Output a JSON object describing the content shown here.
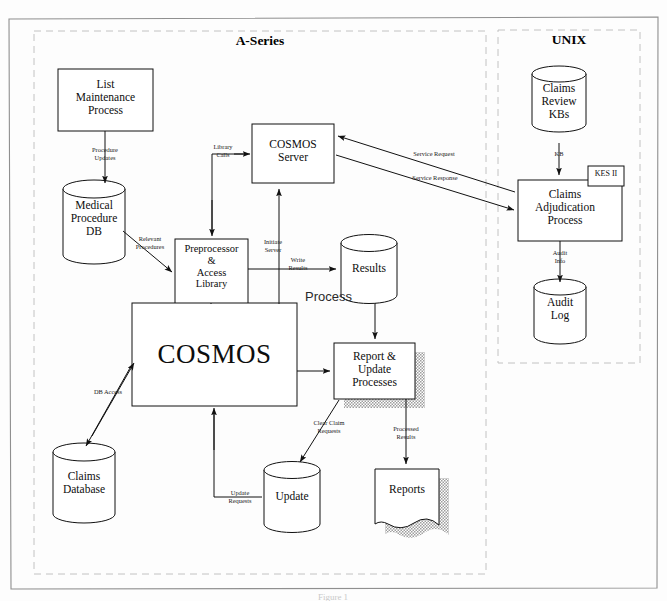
{
  "figure": {
    "caption": "Figure 1",
    "zones": [
      {
        "id": "a-series",
        "title": "A-Series"
      },
      {
        "id": "unix",
        "title": "UNIX"
      }
    ],
    "free_labels": [
      {
        "id": "process-label",
        "text": "Process"
      }
    ]
  },
  "nodes": [
    {
      "id": "list-maintenance-process",
      "shape": "rect",
      "label": "List\nMaintenance\nProcess"
    },
    {
      "id": "medical-procedure-db",
      "shape": "cylinder",
      "label": "Medical\nProcedure\nDB"
    },
    {
      "id": "cosmos-server",
      "shape": "rect",
      "label": "COSMOS\nServer"
    },
    {
      "id": "preprocessor-access-library",
      "shape": "rect",
      "label": "Preprocessor\n&\nAccess\nLibrary"
    },
    {
      "id": "cosmos",
      "shape": "rect",
      "label": "COSMOS"
    },
    {
      "id": "results",
      "shape": "cylinder",
      "label": "Results"
    },
    {
      "id": "report-update-processes",
      "shape": "rect-shadow",
      "label": "Report &\nUpdate\nProcesses"
    },
    {
      "id": "claims-database",
      "shape": "cylinder",
      "label": "Claims\nDatabase"
    },
    {
      "id": "update",
      "shape": "cylinder",
      "label": "Update"
    },
    {
      "id": "reports",
      "shape": "document",
      "label": "Reports"
    },
    {
      "id": "claims-review-kbs",
      "shape": "cylinder",
      "label": "Claims\nReview\nKBs"
    },
    {
      "id": "claims-adjudication-process",
      "shape": "rect",
      "label": "Claims\nAdjudication\nProcess"
    },
    {
      "id": "kes-ii",
      "shape": "rect",
      "label": "KES II"
    },
    {
      "id": "audit-log",
      "shape": "cylinder",
      "label": "Audit\nLog"
    }
  ],
  "edges": [
    {
      "id": "procedure-updates",
      "from": "list-maintenance-process",
      "to": "medical-procedure-db",
      "label": "Procedure\nUpdates"
    },
    {
      "id": "relevant-procedures",
      "from": "medical-procedure-db",
      "to": "preprocessor-access-library",
      "label": "Relevant\nProcedures"
    },
    {
      "id": "library-calls",
      "from": "cosmos-server",
      "to": "preprocessor-access-library",
      "label": "Library\nCalls"
    },
    {
      "id": "initiate-server",
      "from": "preprocessor-access-library",
      "to": "cosmos-server",
      "label": "Initiate\nServer"
    },
    {
      "id": "write-results",
      "from": "preprocessor-access-library",
      "to": "results",
      "label": "Write\nResults"
    },
    {
      "id": "service-request",
      "from": "claims-adjudication-process",
      "to": "cosmos-server",
      "label": "Service Request"
    },
    {
      "id": "service-response",
      "from": "cosmos-server",
      "to": "claims-adjudication-process",
      "label": "Service Response"
    },
    {
      "id": "kb",
      "from": "claims-review-kbs",
      "to": "claims-adjudication-process",
      "label": "KB"
    },
    {
      "id": "audit-info",
      "from": "claims-adjudication-process",
      "to": "audit-log",
      "label": "Audit\nInfo"
    },
    {
      "id": "db-access",
      "from": "cosmos",
      "to": "claims-database",
      "label": "DB Access"
    },
    {
      "id": "update-requests",
      "from": "update",
      "to": "cosmos",
      "label": "Update\nRequests"
    },
    {
      "id": "clear-claim-requests",
      "from": "report-update-processes",
      "to": "update",
      "label": "Clear Claim\nRequests"
    },
    {
      "id": "processed-results",
      "from": "report-update-processes",
      "to": "reports",
      "label": "Processed\nResults"
    },
    {
      "id": "results-to-report",
      "from": "results",
      "to": "report-update-processes",
      "label": ""
    },
    {
      "id": "cosmos-to-report",
      "from": "cosmos",
      "to": "report-update-processes",
      "label": ""
    }
  ],
  "colors": {
    "stroke": "#111111",
    "zone_border": "#bdbdbd",
    "outer_border": "#8a8a8a",
    "shadow_fill": "#bcbcbc",
    "page_bg": "#fdfdfd"
  }
}
